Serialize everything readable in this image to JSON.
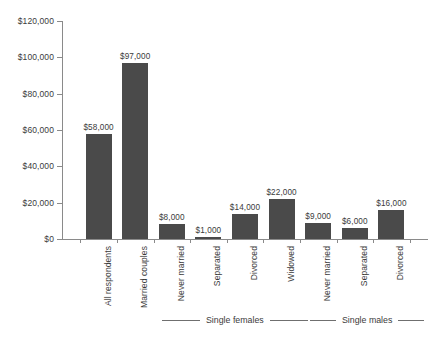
{
  "chart_data": {
    "type": "bar",
    "title": "",
    "subtitle": "",
    "xlabel": "",
    "ylabel": "",
    "ylim": [
      0,
      120000
    ],
    "grid": false,
    "legend_position": "none",
    "categories": [
      "All respondents",
      "Married couples",
      "Never married",
      "Separated",
      "Divorced",
      "Widowed",
      "Never married",
      "Separated",
      "Divorced"
    ],
    "values": [
      58000,
      97000,
      8000,
      1000,
      14000,
      22000,
      9000,
      6000,
      16000
    ],
    "value_labels": [
      "$58,000",
      "$97,000",
      "$8,000",
      "$1,000",
      "$14,000",
      "$22,000",
      "$9,000",
      "$6,000",
      "$16,000"
    ],
    "ytick_values": [
      0,
      20000,
      40000,
      60000,
      80000,
      100000,
      120000
    ],
    "ytick_labels": [
      "$0",
      "$20,000",
      "$40,000",
      "$60,000",
      "$80,000",
      "$100,000",
      "$120,000"
    ],
    "group_annotations": [
      {
        "label": "Single females",
        "covers": [
          "Never married",
          "Separated",
          "Divorced",
          "Widowed"
        ]
      },
      {
        "label": "Single males",
        "covers": [
          "Never married",
          "Separated",
          "Divorced"
        ]
      }
    ],
    "bar_color": "#4a4a4a",
    "axis_color": "#8a8a8a",
    "text_color": "#3b3b3b",
    "background_color": "#ffffff"
  }
}
